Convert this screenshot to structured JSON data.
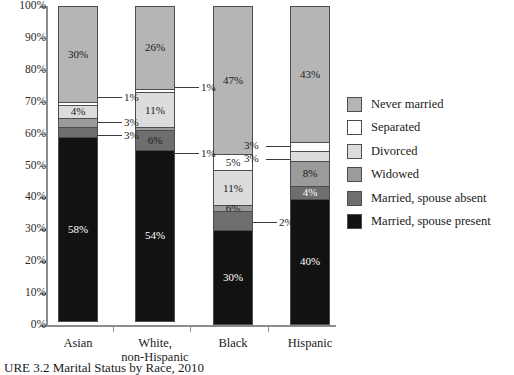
{
  "caption": "URE 3.2  Marital Status by Race, 2010",
  "chart_data": {
    "type": "bar",
    "subtype": "stacked-bar-100pct",
    "title": "",
    "xlabel": "",
    "ylabel": "",
    "ylim": [
      0,
      100
    ],
    "grid": false,
    "legend_position": "right",
    "categories": [
      "Asian",
      "White,\nnon-Hispanic",
      "Black",
      "Hispanic"
    ],
    "tick_labels": [
      "0%",
      "10%",
      "20%",
      "30%",
      "40%",
      "50%",
      "60%",
      "70%",
      "80%",
      "90%",
      "100%"
    ],
    "tick_values": [
      0,
      10,
      20,
      30,
      40,
      50,
      60,
      70,
      80,
      90,
      100
    ],
    "series": [
      {
        "name": "Married, spouse present",
        "color": "#121212",
        "values": [
          58,
          54,
          30,
          40
        ]
      },
      {
        "name": "Married, spouse absent",
        "color": "#6e6e6e",
        "values": [
          3,
          6,
          6,
          4
        ]
      },
      {
        "name": "Widowed",
        "color": "#9b9b9b",
        "values": [
          3,
          1,
          2,
          8
        ]
      },
      {
        "name": "Divorced",
        "color": "#dcdcdc",
        "values": [
          4,
          11,
          11,
          3
        ]
      },
      {
        "name": "Separated",
        "color": "#ffffff",
        "values": [
          1,
          1,
          5,
          3
        ]
      },
      {
        "name": "Never married",
        "color": "#b5b5b5",
        "values": [
          30,
          26,
          47,
          43
        ]
      }
    ]
  },
  "axis": {
    "ticks": [
      {
        "label": "100%",
        "value": 100
      },
      {
        "label": "90%",
        "value": 90
      },
      {
        "label": "80%",
        "value": 80
      },
      {
        "label": "70%",
        "value": 70
      },
      {
        "label": "60%",
        "value": 60
      },
      {
        "label": "50%",
        "value": 50
      },
      {
        "label": "40%",
        "value": 40
      },
      {
        "label": "30%",
        "value": 30
      },
      {
        "label": "20%",
        "value": 20
      },
      {
        "label": "10%",
        "value": 10
      },
      {
        "label": "0%",
        "value": 0
      }
    ]
  },
  "categories": [
    {
      "line1": "Asian",
      "line2": ""
    },
    {
      "line1": "White,",
      "line2": "non-Hispanic"
    },
    {
      "line1": "Black",
      "line2": ""
    },
    {
      "line1": "Hispanic",
      "line2": ""
    }
  ],
  "bars": {
    "asian": {
      "name": "Asian",
      "segments": [
        {
          "series": "Never married",
          "label": "30%",
          "inside": true,
          "text": "dark"
        },
        {
          "series": "Separated",
          "label": "1%",
          "inside": false,
          "text": "dark"
        },
        {
          "series": "Divorced",
          "label": "4%",
          "inside": true,
          "text": "dark"
        },
        {
          "series": "Widowed",
          "label": "3%",
          "inside": false,
          "text": "dark"
        },
        {
          "series": "Married, spouse absent",
          "label": "3%",
          "inside": false,
          "text": "dark"
        },
        {
          "series": "Married, spouse present",
          "label": "58%",
          "inside": true,
          "text": "light"
        }
      ]
    },
    "white": {
      "name": "White, non-Hispanic",
      "segments": [
        {
          "series": "Never married",
          "label": "26%",
          "inside": true,
          "text": "dark"
        },
        {
          "series": "Separated",
          "label": "1%",
          "inside": false,
          "text": "dark"
        },
        {
          "series": "Divorced",
          "label": "11%",
          "inside": true,
          "text": "dark"
        },
        {
          "series": "Widowed",
          "label": "1%",
          "inside": false,
          "text": "dark"
        },
        {
          "series": "Married, spouse absent",
          "label": "6%",
          "inside": true,
          "text": "dark"
        },
        {
          "series": "Married, spouse present",
          "label": "54%",
          "inside": true,
          "text": "light"
        }
      ]
    },
    "black": {
      "name": "Black",
      "segments": [
        {
          "series": "Never married",
          "label": "47%",
          "inside": true,
          "text": "dark"
        },
        {
          "series": "Separated",
          "label": "5%",
          "inside": true,
          "text": "dark"
        },
        {
          "series": "Divorced",
          "label": "11%",
          "inside": true,
          "text": "dark"
        },
        {
          "series": "Widowed",
          "label": "6%",
          "inside": true,
          "text": "dark"
        },
        {
          "series": "Married, spouse absent",
          "label": "2%",
          "inside": false,
          "text": "dark"
        },
        {
          "series": "Married, spouse present",
          "label": "30%",
          "inside": true,
          "text": "light"
        }
      ]
    },
    "hispanic": {
      "name": "Hispanic",
      "segments": [
        {
          "series": "Never married",
          "label": "43%",
          "inside": true,
          "text": "dark"
        },
        {
          "series": "Separated",
          "label": "3%",
          "inside": false,
          "text": "dark"
        },
        {
          "series": "Divorced",
          "label": "3%",
          "inside": false,
          "text": "dark"
        },
        {
          "series": "Widowed",
          "label": "8%",
          "inside": true,
          "text": "dark"
        },
        {
          "series": "Married, spouse absent",
          "label": "4%",
          "inside": true,
          "text": "light"
        },
        {
          "series": "Married, spouse present",
          "label": "40%",
          "inside": true,
          "text": "light"
        }
      ]
    }
  },
  "callouts": {
    "asian_separated": "1%",
    "asian_widowed": "3%",
    "asian_absent": "3%",
    "white_separated": "1%",
    "white_widowed": "1%",
    "black_absent": "2%",
    "hispanic_separated": "3%",
    "hispanic_divorced": "3%"
  },
  "legend": {
    "items": [
      {
        "label": "Never married",
        "color": "#b5b5b5"
      },
      {
        "label": "Separated",
        "color": "#ffffff"
      },
      {
        "label": "Divorced",
        "color": "#dcdcdc"
      },
      {
        "label": "Widowed",
        "color": "#9b9b9b"
      },
      {
        "label": "Married, spouse absent",
        "color": "#6e6e6e"
      },
      {
        "label": "Married, spouse present",
        "color": "#121212"
      }
    ]
  }
}
